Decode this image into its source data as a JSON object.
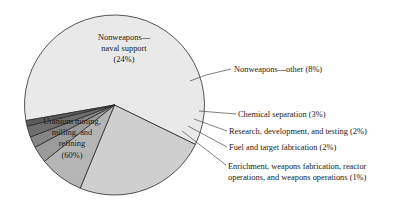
{
  "chart_data": {
    "type": "pie",
    "title": "",
    "subtitle": "",
    "units": "percent",
    "legend_position": "none",
    "categories": [
      "Uranium mining, milling, and refining",
      "Nonweapons—naval support",
      "Nonweapons—other",
      "Chemical separation",
      "Research, development, and testing",
      "Fuel and target fabrication",
      "Enrichment, weapons fabrication, reactor operations, and weapons operations"
    ],
    "values": [
      60,
      24,
      8,
      3,
      2,
      2,
      1
    ],
    "slices": [
      {
        "id": "uranium-mining",
        "label_lines": [
          "Uranium mining,",
          "milling, and",
          "refining",
          "(60%)"
        ],
        "percent_text": "(60%)",
        "value": 60,
        "color": "#e9e9e9",
        "label_placement": "inside",
        "label_x": 72,
        "label_y": 124
      },
      {
        "id": "naval-support",
        "label_lines": [
          "Nonweapons—",
          "naval support",
          "(24%)"
        ],
        "percent_text": "(24%)",
        "value": 24,
        "color": "#cfcfcf",
        "label_placement": "inside",
        "label_x": 124,
        "label_y": 40
      },
      {
        "id": "nonweapons-other",
        "label_lines": [
          "Nonweapons—other (8%)"
        ],
        "percent_text": "(8%)",
        "value": 8,
        "color": "#b5b5b5",
        "label_placement": "outside",
        "label_x": 234,
        "label_y": 72,
        "leader": [
          [
            190,
            81
          ],
          [
            206,
            75
          ],
          [
            231,
            69
          ]
        ]
      },
      {
        "id": "chemical-separation",
        "label_lines": [
          "Chemical separation (3%)"
        ],
        "percent_text": "(3%)",
        "value": 3,
        "color": "#9b9b9b",
        "label_placement": "outside",
        "label_x": 238,
        "label_y": 117,
        "leader": [
          [
            199,
            111
          ],
          [
            236,
            114
          ]
        ]
      },
      {
        "id": "research-development-testing",
        "label_lines": [
          "Research, development, and testing (2%)"
        ],
        "percent_text": "(2%)",
        "value": 2,
        "color": "#858585",
        "label_placement": "outside",
        "label_x": 229,
        "label_y": 134,
        "leader": [
          [
            194,
            119
          ],
          [
            227,
            131
          ]
        ]
      },
      {
        "id": "fuel-target-fabrication",
        "label_lines": [
          "Fuel and target fabrication (2%)"
        ],
        "percent_text": "(2%)",
        "value": 2,
        "color": "#6e6e6e",
        "label_placement": "outside",
        "label_x": 229,
        "label_y": 150,
        "leader": [
          [
            188,
            126
          ],
          [
            227,
            147
          ]
        ]
      },
      {
        "id": "enrichment-weapons-reactor",
        "label_lines": [
          "Enrichment, weapons fabrication, reactor",
          "operations, and weapons operations (1%)"
        ],
        "percent_text": "(1%)",
        "value": 1,
        "color": "#5a5a5a",
        "label_placement": "outside",
        "label_x": 228,
        "label_y": 169,
        "leader": [
          [
            182,
            131
          ],
          [
            226,
            165
          ]
        ]
      }
    ],
    "geometry": {
      "center_x": 114.5,
      "center_y": 105,
      "radius": 90,
      "start_angle_deg": 170
    },
    "colors": {
      "outline": "#2b2b2b",
      "leader": "#4a4a4a",
      "text": "#1a1a1a",
      "background": "#ffffff"
    }
  }
}
